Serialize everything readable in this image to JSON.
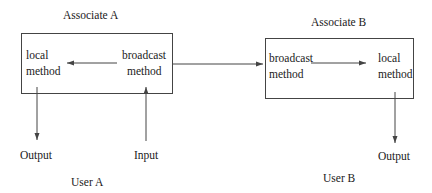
{
  "diagram": {
    "associates": [
      {
        "title": "Associate A",
        "local_method": [
          "local",
          "method"
        ],
        "broadcast_method": [
          "broadcast",
          "method"
        ],
        "user": "User A",
        "output_label": "Output",
        "input_label": "Input"
      },
      {
        "title": "Associate B",
        "broadcast_method": [
          "broadcast",
          "method"
        ],
        "local_method": [
          "local",
          "method"
        ],
        "user": "User B",
        "output_label": "Output"
      }
    ],
    "edges": [
      {
        "from": "Associate A broadcast method",
        "to": "Associate A local method"
      },
      {
        "from": "Associate A broadcast method",
        "to": "Associate B broadcast method"
      },
      {
        "from": "Associate B broadcast method",
        "to": "Associate B local method"
      },
      {
        "from": "Input",
        "to": "Associate A broadcast method"
      },
      {
        "from": "Associate A local method",
        "to": "Output (User A)"
      },
      {
        "from": "Associate B local method",
        "to": "Output (User B)"
      }
    ],
    "colors": {
      "line": "#444444",
      "text": "#1a1a1a",
      "background": "#ffffff"
    }
  }
}
